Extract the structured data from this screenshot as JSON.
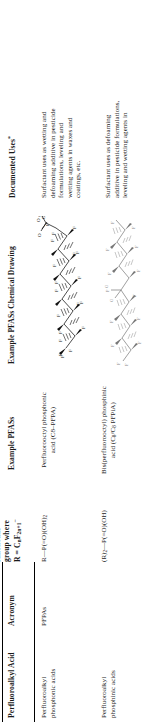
{
  "table": {
    "headers": [
      "Perfluoroalkyl Acid",
      "Acronym",
      "functional group where R = CₙF₂ₙ₊₁⁻",
      "Example PFASs",
      "Example PFASs Chemical Drawing",
      "Documented Uses*"
    ],
    "header_parts": {
      "functional_line1": "functional",
      "functional_line2": "group where",
      "functional_line3_prefix": "R = C",
      "functional_line3_sub1": "n",
      "functional_line3_mid": "F",
      "functional_line3_sub2": "2n+1",
      "functional_line3_sup": "−",
      "documented_uses_base": "Documented Uses",
      "documented_uses_star": "*"
    },
    "rows": [
      {
        "acid_line1": "Perfluoroalkyl",
        "acid_line2": "phosphonic acids",
        "acronym": "PFPAs",
        "functional_group": "R—P(=O)(OH)₂",
        "functional_group_parts": {
          "main": "R—P(=O)(OH)",
          "sub": "2"
        },
        "example_line1": "Perfluorooctyl phosphonic",
        "example_line2": "acid (C8–PFPA)",
        "uses_lines": [
          "Surfactant uses as wetting and",
          "defoaming additive in pesticide",
          "formulations, leveling and",
          "wetting agents in waxes and",
          "coatings, etc."
        ],
        "chem_labels": {
          "O_double": "O",
          "O_minus": "O",
          "O_minus_charge": "⊖",
          "OH": "OH",
          "P": "P",
          "F": "F"
        }
      },
      {
        "acid_line1": "Perfluoroalkyl",
        "acid_line2": "phosphinic acids",
        "acronym": "",
        "functional_group": "(R)₂—P(=O)(OH)",
        "functional_group_parts": {
          "prefix": "(R)",
          "prefix_sub": "2",
          "main": "—P(=O)(OH)"
        },
        "example_line1": "Bis(perfluorooctyl) phosphinic",
        "example_line2_prefix": "acid (C",
        "example_line2_sub1": "8",
        "example_line2_mid": "/C",
        "example_line2_sub2": "8",
        "example_line2_suffix": " PFPiA)",
        "uses_lines": [
          "Surfactant uses as defoaming",
          "additive in pesticide formulations,",
          "leveling and wetting agents in"
        ]
      }
    ]
  },
  "colors": {
    "rule": "#000000",
    "text": "#1a1a1a",
    "structure": "#111111"
  }
}
